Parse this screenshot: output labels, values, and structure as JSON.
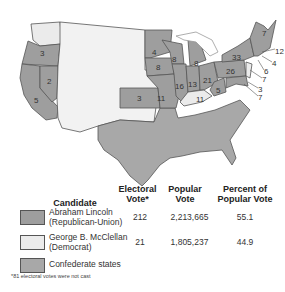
{
  "map": {
    "title": "Election of 1864",
    "colors": {
      "lincoln": "#9e9e9e",
      "mcclellan": "#ebebeb",
      "confederate": "#a8a8a8",
      "border": "#555555",
      "water": "#ffffff"
    },
    "state_labels": [
      {
        "state": "Oregon",
        "votes": "3"
      },
      {
        "state": "Nevada",
        "votes": "2"
      },
      {
        "state": "California",
        "votes": "5"
      },
      {
        "state": "Kansas",
        "votes": "3"
      },
      {
        "state": "Minnesota",
        "votes": "4"
      },
      {
        "state": "Wisconsin",
        "votes": "8"
      },
      {
        "state": "Iowa",
        "votes": "8"
      },
      {
        "state": "Michigan",
        "votes": "8"
      },
      {
        "state": "Missouri",
        "votes": "11"
      },
      {
        "state": "Illinois",
        "votes": "16"
      },
      {
        "state": "Indiana",
        "votes": "13"
      },
      {
        "state": "Ohio",
        "votes": "21"
      },
      {
        "state": "Kentucky",
        "votes": "11"
      },
      {
        "state": "West Virginia",
        "votes": "5"
      },
      {
        "state": "Pennsylvania",
        "votes": "26"
      },
      {
        "state": "New York",
        "votes": "33"
      },
      {
        "state": "Maine",
        "votes": "7"
      },
      {
        "state": "Massachusetts",
        "votes": "12"
      },
      {
        "state": "Rhode Island",
        "votes": "4"
      },
      {
        "state": "Connecticut",
        "votes": "6"
      },
      {
        "state": "New Jersey",
        "votes": "7"
      },
      {
        "state": "Delaware",
        "votes": "3"
      },
      {
        "state": "Maryland",
        "votes": "7"
      }
    ]
  },
  "legend": {
    "headers": {
      "candidate": "Candidate",
      "electoral_1": "Electoral",
      "electoral_2": "Vote*",
      "popular_1": "Popular",
      "popular_2": "Vote",
      "percent_1": "Percent of",
      "percent_2": "Popular Vote"
    },
    "rows": [
      {
        "name_1": "Abraham Lincoln",
        "name_2": "(Republican-Union)",
        "electoral": "212",
        "popular": "2,213,665",
        "percent": "55.1"
      },
      {
        "name_1": "George B. McClellan",
        "name_2": "(Democrat)",
        "electoral": "21",
        "popular": "1,805,237",
        "percent": "44.9"
      },
      {
        "name_1": "Confederate states",
        "name_2": "",
        "electoral": "",
        "popular": "",
        "percent": ""
      }
    ],
    "footnote": "*81 electoral votes were not cast"
  }
}
